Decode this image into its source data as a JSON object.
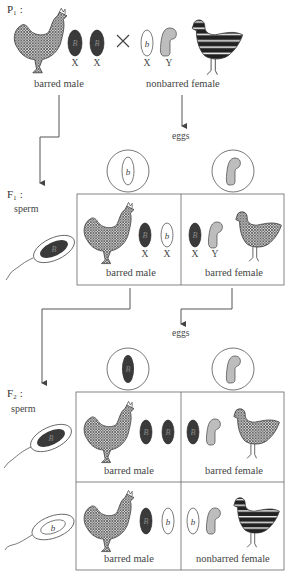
{
  "generations": {
    "p1": {
      "label": "P₁ :",
      "male": {
        "label": "barred male",
        "chromosomes": [
          {
            "type": "X",
            "allele": "B",
            "fill": "#3a3a3a"
          },
          {
            "type": "X",
            "allele": "B",
            "fill": "#3a3a3a"
          }
        ]
      },
      "cross_symbol": "×",
      "female": {
        "label": "nonbarred female",
        "chromosomes": [
          {
            "type": "X",
            "allele": "b",
            "fill": "#ffffff"
          },
          {
            "type": "Y",
            "allele": "",
            "fill": "#bdbdbd"
          }
        ]
      }
    },
    "f1": {
      "label": "F₁ :",
      "sperm_label": "sperm",
      "eggs_label": "eggs",
      "sperm": [
        {
          "allele": "B"
        }
      ],
      "eggs": [
        {
          "type": "X",
          "allele": "b"
        },
        {
          "type": "Y",
          "allele": ""
        }
      ],
      "offspring": [
        {
          "label": "barred male",
          "chromosomes": [
            {
              "type": "X",
              "allele": "B"
            },
            {
              "type": "X",
              "allele": "b"
            }
          ]
        },
        {
          "label": "barred female",
          "chromosomes": [
            {
              "type": "X",
              "allele": "B"
            },
            {
              "type": "Y",
              "allele": ""
            }
          ]
        }
      ]
    },
    "f2": {
      "label": "F₂ :",
      "sperm_label": "sperm",
      "eggs_label": "eggs",
      "sperm": [
        {
          "allele": "B"
        },
        {
          "allele": "b"
        }
      ],
      "eggs": [
        {
          "type": "X",
          "allele": "B"
        },
        {
          "type": "Y",
          "allele": ""
        }
      ],
      "offspring": [
        {
          "label": "barred male",
          "chromosomes": [
            {
              "type": "X",
              "allele": "B"
            },
            {
              "type": "X",
              "allele": "B"
            }
          ]
        },
        {
          "label": "barred female",
          "chromosomes": [
            {
              "type": "X",
              "allele": "B"
            },
            {
              "type": "Y",
              "allele": ""
            }
          ]
        },
        {
          "label": "barred male",
          "chromosomes": [
            {
              "type": "X",
              "allele": "B"
            },
            {
              "type": "X",
              "allele": "b"
            }
          ]
        },
        {
          "label": "nonbarred female",
          "chromosomes": [
            {
              "type": "X",
              "allele": "b"
            },
            {
              "type": "Y",
              "allele": ""
            }
          ]
        }
      ]
    }
  },
  "colors": {
    "dominant_chromosome": "#3a3a3a",
    "recessive_chromosome": "#ffffff",
    "y_chromosome": "#bdbdbd",
    "line": "#555555"
  }
}
